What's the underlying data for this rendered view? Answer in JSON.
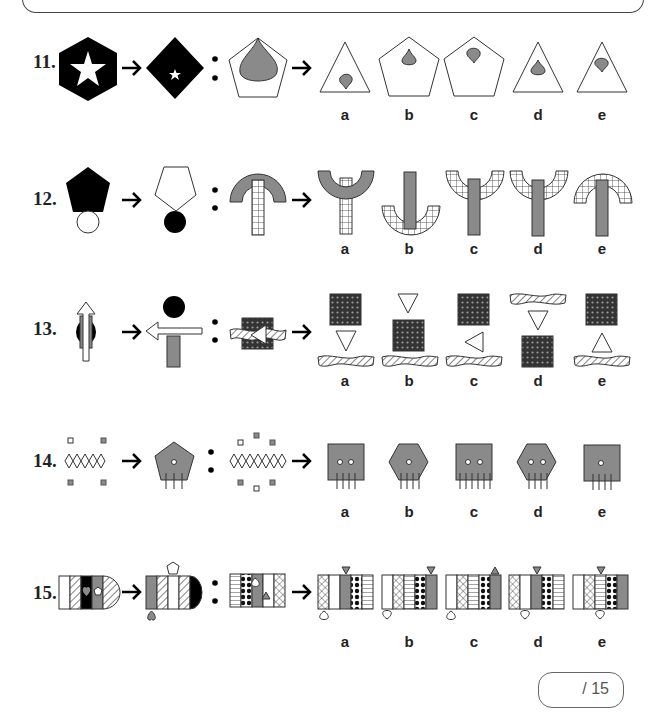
{
  "questions": [
    {
      "number": "11.",
      "options": [
        "a",
        "b",
        "c",
        "d",
        "e"
      ]
    },
    {
      "number": "12.",
      "options": [
        "a",
        "b",
        "c",
        "d",
        "e"
      ]
    },
    {
      "number": "13.",
      "options": [
        "a",
        "b",
        "c",
        "d",
        "e"
      ]
    },
    {
      "number": "14.",
      "options": [
        "a",
        "b",
        "c",
        "d",
        "e"
      ]
    },
    {
      "number": "15.",
      "options": [
        "a",
        "b",
        "c",
        "d",
        "e"
      ]
    }
  ],
  "score_box": {
    "label": "/ 15"
  },
  "colors": {
    "black": "#000000",
    "grey": "#8a8a8a",
    "outline": "#444444"
  }
}
